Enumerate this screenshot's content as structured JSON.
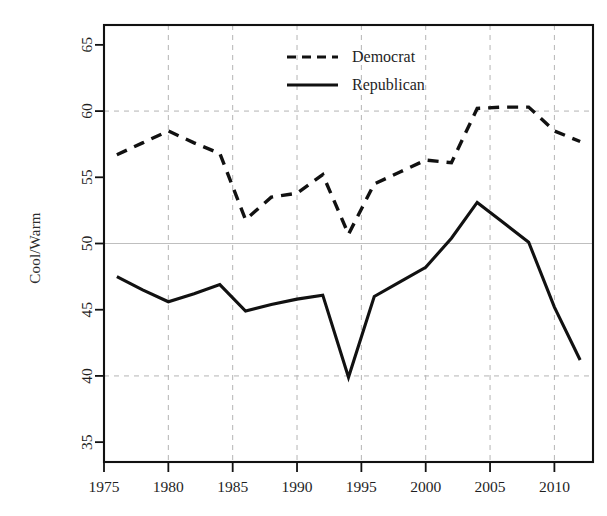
{
  "figure": {
    "background_color": "#ffffff",
    "ink_color": "#111111",
    "grid_color": "#b4b4b4"
  },
  "axes": {
    "y_axis_label": "Cool/Warm",
    "y_ticks": [
      "35",
      "40",
      "45",
      "50",
      "55",
      "60",
      "65"
    ],
    "x_ticks": [
      "1975",
      "1980",
      "1985",
      "1990",
      "1995",
      "2000",
      "2005",
      "2010"
    ]
  },
  "legend": {
    "position": "top-center",
    "entries": [
      {
        "label": "Democrat",
        "style": "dashed"
      },
      {
        "label": "Republican",
        "style": "solid"
      }
    ]
  },
  "chart_data": {
    "type": "line",
    "title": "",
    "xlabel": "",
    "ylabel": "Cool/Warm",
    "xlim": [
      1975,
      2013
    ],
    "ylim": [
      33.5,
      66.5
    ],
    "grid": true,
    "gridlines_y": [
      40,
      50,
      60
    ],
    "gridlines_x": [
      1975,
      1980,
      1985,
      1990,
      1995,
      2000,
      2005,
      2010
    ],
    "legend_position": "top-center",
    "x": [
      1976,
      1978,
      1980,
      1982,
      1984,
      1986,
      1988,
      1990,
      1992,
      1994,
      1996,
      1998,
      2000,
      2002,
      2004,
      2006,
      2008,
      2010,
      2012
    ],
    "series": [
      {
        "name": "Democrat",
        "style": "dashed",
        "values": [
          56.7,
          57.6,
          58.5,
          57.6,
          56.8,
          51.8,
          53.5,
          53.8,
          55.2,
          50.7,
          54.5,
          55.4,
          56.3,
          56.1,
          60.2,
          60.3,
          60.3,
          58.5,
          57.7
        ]
      },
      {
        "name": "Republican",
        "style": "solid",
        "values": [
          47.5,
          46.5,
          45.6,
          46.2,
          46.9,
          44.9,
          45.4,
          45.8,
          46.1,
          39.9,
          46.0,
          47.1,
          48.2,
          50.4,
          53.1,
          51.6,
          50.1,
          45.2,
          41.2
        ]
      }
    ]
  }
}
